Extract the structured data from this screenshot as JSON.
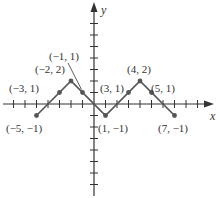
{
  "chart_data": {
    "type": "line",
    "title": "",
    "xlabel": "x",
    "ylabel": "y",
    "xlim": [
      -8,
      9
    ],
    "ylim": [
      -8,
      8
    ],
    "grid": false,
    "points": [
      {
        "x": -5,
        "y": -1,
        "label": "(−5, −1)"
      },
      {
        "x": -3,
        "y": 1,
        "label": "(−3, 1)"
      },
      {
        "x": -2,
        "y": 2,
        "label": "(−2, 2)"
      },
      {
        "x": -1,
        "y": 1,
        "label": "(−1, 1)"
      },
      {
        "x": 1,
        "y": -1,
        "label": "(1, −1)"
      },
      {
        "x": 3,
        "y": 1,
        "label": "(3, 1)"
      },
      {
        "x": 4,
        "y": 2,
        "label": "(4, 2)"
      },
      {
        "x": 5,
        "y": 1,
        "label": "(5, 1)"
      },
      {
        "x": 7,
        "y": -1,
        "label": "(7, −1)"
      }
    ],
    "series": [
      {
        "name": "piecewise",
        "x": [
          -5,
          -2,
          1,
          4,
          7
        ],
        "y": [
          -1,
          2,
          -1,
          2,
          -1
        ]
      }
    ]
  },
  "axes": {
    "x_label": "x",
    "y_label": "y"
  },
  "colors": {
    "line": "#555555",
    "axis": "#333333",
    "text": "#333333"
  }
}
